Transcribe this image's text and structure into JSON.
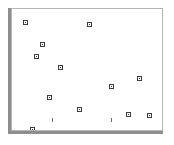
{
  "chart_data": {
    "type": "scatter",
    "title": "",
    "subtitle": "",
    "xlabel": "",
    "ylabel": "",
    "xlim": [
      0,
      150
    ],
    "ylim": [
      0,
      121
    ],
    "grid": false,
    "legend": null,
    "marker": {
      "shape": "square-outline",
      "size_px": 5,
      "edge_color": "#3c3c3c",
      "face_color": "#ffffff"
    },
    "series": [
      {
        "name": "series-1",
        "points": [
          {
            "x": 13,
            "y": 13
          },
          {
            "x": 77,
            "y": 15
          },
          {
            "x": 30,
            "y": 35
          },
          {
            "x": 24,
            "y": 47
          },
          {
            "x": 48,
            "y": 58
          },
          {
            "x": 127,
            "y": 69
          },
          {
            "x": 99,
            "y": 77
          },
          {
            "x": 37,
            "y": 88
          },
          {
            "x": 67,
            "y": 100
          },
          {
            "x": 116,
            "y": 105
          },
          {
            "x": 137,
            "y": 106
          },
          {
            "x": 20,
            "y": 120
          }
        ]
      }
    ],
    "axis_ticks": {
      "x": [
        {
          "position": 40,
          "label": ""
        },
        {
          "position": 99,
          "label": ""
        }
      ],
      "y": []
    }
  },
  "frame": {
    "border_color": "#b5b5b5",
    "shadow_color": "#8e8e8e",
    "background": "#ffffff"
  }
}
